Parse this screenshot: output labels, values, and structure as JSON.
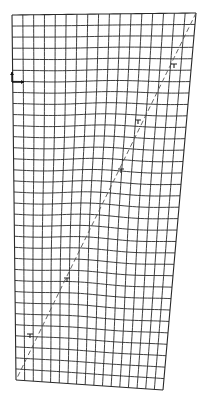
{
  "diagram": {
    "type": "deformed-mesh",
    "background": "#ffffff",
    "line_color": "#2a2a2a",
    "mesh": {
      "columns": 17,
      "rows": 33,
      "corners": {
        "top_left": [
          12,
          15
        ],
        "top_right": [
          196,
          13
        ],
        "bottom_right": [
          163,
          390
        ],
        "bottom_left": [
          16,
          380
        ]
      },
      "distortion_amplitude": 1.6
    },
    "dashed_line": {
      "start": [
        196,
        13
      ],
      "end": [
        17,
        378
      ],
      "dash": "5,3"
    },
    "markers": [
      {
        "kind": "tick",
        "x": 174,
        "y": 64
      },
      {
        "kind": "tick",
        "x": 138,
        "y": 120
      },
      {
        "kind": "tick",
        "x": 121,
        "y": 169
      },
      {
        "kind": "tick",
        "x": 67,
        "y": 278
      },
      {
        "kind": "tick",
        "x": 30,
        "y": 334
      }
    ],
    "axes_glyph": {
      "origin": [
        12,
        82
      ],
      "x_arrow_end": [
        24,
        82
      ],
      "y_arrow_end": [
        12,
        72
      ]
    }
  }
}
